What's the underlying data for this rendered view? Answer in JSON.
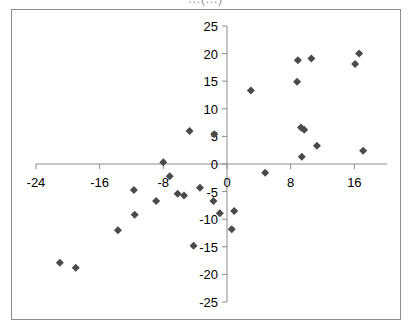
{
  "chart_data": {
    "type": "scatter",
    "title": "",
    "xlabel": "",
    "ylabel": "",
    "xlim": [
      -24,
      20
    ],
    "ylim": [
      -25,
      25
    ],
    "x_ticks": [
      -24,
      -16,
      -8,
      0,
      8,
      16
    ],
    "y_ticks": [
      -25,
      -20,
      -15,
      -10,
      -5,
      0,
      5,
      10,
      15,
      20,
      25
    ],
    "grid": false,
    "legend": null,
    "marker": "diamond",
    "marker_color": "#4a4a4a",
    "series": [
      {
        "name": "Series1",
        "points": [
          {
            "x": 3.0,
            "y": 13.3
          },
          {
            "x": 8.9,
            "y": 18.8
          },
          {
            "x": 10.6,
            "y": 19.1
          },
          {
            "x": 8.8,
            "y": 14.9
          },
          {
            "x": 16.6,
            "y": 20.0
          },
          {
            "x": 16.1,
            "y": 18.1
          },
          {
            "x": 9.3,
            "y": 6.6
          },
          {
            "x": 9.7,
            "y": 6.2
          },
          {
            "x": 11.3,
            "y": 3.3
          },
          {
            "x": 9.4,
            "y": 1.3
          },
          {
            "x": 17.1,
            "y": 2.4
          },
          {
            "x": 4.8,
            "y": -1.6
          },
          {
            "x": -4.7,
            "y": 6.0
          },
          {
            "x": -1.6,
            "y": 5.4
          },
          {
            "x": -8.0,
            "y": 0.3
          },
          {
            "x": -7.2,
            "y": -2.2
          },
          {
            "x": -11.7,
            "y": -4.7
          },
          {
            "x": -6.2,
            "y": -5.4
          },
          {
            "x": -5.4,
            "y": -5.7
          },
          {
            "x": -3.4,
            "y": -4.3
          },
          {
            "x": -8.9,
            "y": -6.7
          },
          {
            "x": -1.7,
            "y": -6.7
          },
          {
            "x": -11.6,
            "y": -9.2
          },
          {
            "x": -0.9,
            "y": -8.9
          },
          {
            "x": 0.9,
            "y": -8.5
          },
          {
            "x": 0.6,
            "y": -11.8
          },
          {
            "x": -13.7,
            "y": -12.0
          },
          {
            "x": -4.2,
            "y": -14.8
          },
          {
            "x": -21.0,
            "y": -17.9
          },
          {
            "x": -19.0,
            "y": -18.8
          }
        ]
      }
    ]
  },
  "title_strip": "…(…)"
}
